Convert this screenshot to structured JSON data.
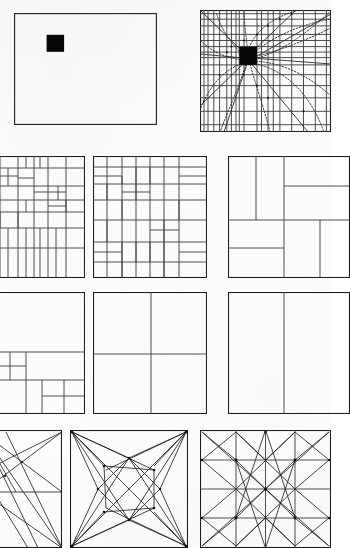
{
  "figure": {
    "domain": "diagram",
    "kind": "geometric-proportion-plate",
    "background_color": "#fdfdfc",
    "ink_color": "#1e1e1e",
    "accent_color": "#060606",
    "rows": 4,
    "columns": 3,
    "note_visible_text": ""
  },
  "panels": [
    {
      "id": "p1",
      "row": 1,
      "col": 1,
      "name": "plain-rectangle-with-black-square",
      "x": 14,
      "y": 13,
      "w": 143,
      "h": 112,
      "frame": true,
      "marker": {
        "x": 0.228,
        "y": 0.195,
        "w": 0.122,
        "h": 0.152,
        "color": "#060606"
      },
      "grid_v": [],
      "grid_h": [],
      "dotted_curves": false,
      "rays": false
    },
    {
      "id": "p2",
      "row": 1,
      "col": 2,
      "name": "rectangle-with-regulating-grid-and-dotted-curves",
      "x": 200,
      "y": 10,
      "w": 131,
      "h": 122,
      "frame": true,
      "marker": {
        "x": 0.3,
        "y": 0.3,
        "w": 0.135,
        "h": 0.15,
        "color": "#060606"
      },
      "grid_v": [
        0.03,
        0.062,
        0.105,
        0.15,
        0.205,
        0.24,
        0.275,
        0.3,
        0.336,
        0.435,
        0.47,
        0.52,
        0.56,
        0.61,
        0.7,
        0.79,
        0.88,
        0.965
      ],
      "grid_h": [
        0.03,
        0.075,
        0.13,
        0.2,
        0.25,
        0.3,
        0.345,
        0.39,
        0.45,
        0.53,
        0.62,
        0.72,
        0.83,
        0.94
      ],
      "dotted_curves": true,
      "rays": true
    },
    {
      "id": "p3",
      "row": 2,
      "col": 1,
      "name": "irregular-subdivision-grid-left",
      "x": -18,
      "y": 156,
      "w": 103,
      "h": 122,
      "frame": true,
      "clipped_left": true,
      "cells": "dense-rectangular-tiling"
    },
    {
      "id": "p4",
      "row": 2,
      "col": 2,
      "name": "irregular-subdivision-grid-center",
      "x": 93,
      "y": 156,
      "w": 114,
      "h": 122,
      "frame": true,
      "cells": "dense-rectangular-tiling"
    },
    {
      "id": "p5",
      "row": 2,
      "col": 3,
      "name": "coarse-subdivision-grid-right",
      "x": 228,
      "y": 156,
      "w": 122,
      "h": 122,
      "frame": true,
      "clipped_right": true,
      "cells": "coarse-rectangular-tiling"
    },
    {
      "id": "p6",
      "row": 3,
      "col": 1,
      "name": "nested-square-subdivision-left",
      "x": -18,
      "y": 292,
      "w": 103,
      "h": 122,
      "frame": true,
      "clipped_left": true,
      "cells": "nested-squares"
    },
    {
      "id": "p7",
      "row": 3,
      "col": 2,
      "name": "quartered-square-center",
      "x": 93,
      "y": 292,
      "w": 114,
      "h": 122,
      "frame": true,
      "cells": "quarters"
    },
    {
      "id": "p8",
      "row": 3,
      "col": 3,
      "name": "halved-rectangle-right",
      "x": 228,
      "y": 292,
      "w": 122,
      "h": 122,
      "frame": true,
      "clipped_right": true,
      "cells": "vertical-halves"
    },
    {
      "id": "p9",
      "row": 4,
      "col": 1,
      "name": "diagonal-harmonic-armature-left",
      "x": -18,
      "y": 430,
      "w": 80,
      "h": 118,
      "frame": true,
      "clipped_left": true,
      "cells": "diagonals"
    },
    {
      "id": "p10",
      "row": 4,
      "col": 2,
      "name": "diagonal-star-armature-center",
      "x": 70,
      "y": 430,
      "w": 118,
      "h": 118,
      "frame": true,
      "cells": "diagonal-star"
    },
    {
      "id": "p11",
      "row": 4,
      "col": 3,
      "name": "diagonal-lattice-armature-right",
      "x": 200,
      "y": 430,
      "w": 131,
      "h": 118,
      "frame": true,
      "clipped_right": true,
      "cells": "diagonal-lattice"
    }
  ],
  "chart_data": {
    "type": "diagram",
    "title": "",
    "series": [
      {
        "name": "row-1",
        "panels": [
          "plain-rectangle-with-black-square",
          "rectangle-with-regulating-grid-and-dotted-curves"
        ]
      },
      {
        "name": "row-2",
        "panels": [
          "irregular-subdivision-grid-left",
          "irregular-subdivision-grid-center",
          "coarse-subdivision-grid-right"
        ]
      },
      {
        "name": "row-3",
        "panels": [
          "nested-square-subdivision-left",
          "quartered-square-center",
          "halved-rectangle-right"
        ]
      },
      {
        "name": "row-4",
        "panels": [
          "diagonal-harmonic-armature-left",
          "diagonal-star-armature-center",
          "diagonal-lattice-armature-right"
        ]
      }
    ]
  }
}
